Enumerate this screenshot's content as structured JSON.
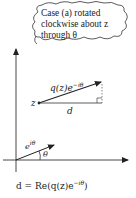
{
  "cloud": {
    "line1": "Case (a) rotated",
    "line2": "clockwise about z",
    "line3": "through θ"
  },
  "labels": {
    "q_vector": "q(z)e",
    "q_vector_exp": "−iθ",
    "z_point": "z",
    "d_label": "d",
    "unit_vector": "e",
    "unit_vector_exp": "iθ",
    "theta": "θ"
  },
  "formula": {
    "lhs": "d = Re(q(z)e",
    "exp": "−iθ",
    "rhs": ")"
  }
}
